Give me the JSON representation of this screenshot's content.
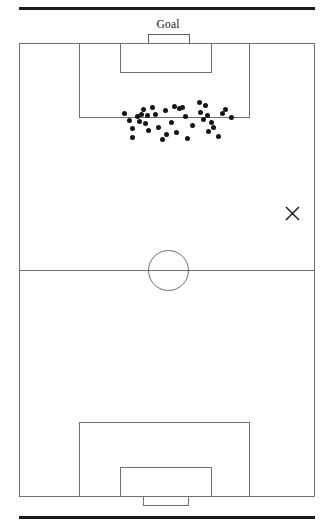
{
  "figure": {
    "type": "soccer-pitch-shot-map",
    "orientation": "vertical",
    "attacking_end": "top",
    "goal_label": "Goal",
    "marker_label": "×",
    "colors": {
      "pitch_line": "#6f6f6f",
      "rule": "#1a1a1a",
      "dot": "#151515",
      "background": "#ffffff"
    },
    "rules": {
      "top": "",
      "bottom": ""
    }
  },
  "chart_data": {
    "type": "scatter",
    "title": "",
    "xlabel": "",
    "ylabel": "",
    "xlim": [
      0,
      296
    ],
    "ylim": [
      0,
      454
    ],
    "grid": false,
    "legend": null,
    "annotations": [
      {
        "name": "goal-label",
        "text": "Goal",
        "x": 149,
        "y": -16
      },
      {
        "name": "reference-cross",
        "text": "×",
        "x": 273,
        "y": 171
      }
    ],
    "pitch_features": [
      {
        "name": "pitch-boundary",
        "x": 0,
        "y": 0,
        "w": 296,
        "h": 454
      },
      {
        "name": "halfway-line",
        "y": 227
      },
      {
        "name": "center-circle",
        "cx": 149,
        "cy": 227,
        "r": 20
      },
      {
        "name": "penalty-area-top",
        "x": 60,
        "y": 0,
        "w": 171,
        "h": 75
      },
      {
        "name": "goal-area-top",
        "x": 101,
        "y": 0,
        "w": 92,
        "h": 30
      },
      {
        "name": "penalty-area-bottom",
        "x": 60,
        "y": 379,
        "w": 171,
        "h": 75
      },
      {
        "name": "goal-area-bottom",
        "x": 101,
        "y": 424,
        "w": 92,
        "h": 30
      },
      {
        "name": "goal-net-bottom",
        "x": 124,
        "y": 454,
        "w": 46,
        "h": 9
      },
      {
        "name": "goal-mouth-bracket-top",
        "x": 129,
        "y": -9,
        "w": 42,
        "h": 9
      }
    ],
    "series": [
      {
        "name": "shots",
        "marker": "circle",
        "color": "#151515",
        "count": 37,
        "points": [
          [
            105,
            70
          ],
          [
            110,
            77
          ],
          [
            113,
            85
          ],
          [
            113,
            94
          ],
          [
            118,
            73
          ],
          [
            120,
            78
          ],
          [
            122,
            71
          ],
          [
            124,
            66
          ],
          [
            126,
            80
          ],
          [
            128,
            72
          ],
          [
            129,
            87
          ],
          [
            133,
            64
          ],
          [
            136,
            71
          ],
          [
            139,
            84
          ],
          [
            143,
            96
          ],
          [
            146,
            67
          ],
          [
            147,
            91
          ],
          [
            152,
            79
          ],
          [
            155,
            63
          ],
          [
            157,
            89
          ],
          [
            160,
            65
          ],
          [
            163,
            64
          ],
          [
            166,
            73
          ],
          [
            168,
            95
          ],
          [
            173,
            82
          ],
          [
            180,
            59
          ],
          [
            181,
            69
          ],
          [
            184,
            76
          ],
          [
            186,
            62
          ],
          [
            188,
            72
          ],
          [
            189,
            88
          ],
          [
            192,
            79
          ],
          [
            194,
            84
          ],
          [
            199,
            93
          ],
          [
            203,
            70
          ],
          [
            206,
            66
          ],
          [
            212,
            74
          ]
        ]
      }
    ]
  }
}
